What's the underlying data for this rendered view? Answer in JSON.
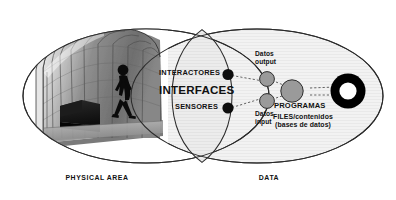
{
  "diagram": {
    "type": "venn-concept-diagram",
    "background_color": "#ffffff",
    "regions": {
      "left": {
        "label": "PHYSICAL AREA",
        "fill": "#ffffff",
        "stroke": "#2b2b2b",
        "photo": {
          "name": "vaulted-interactive-space-photo",
          "description": "grayscale photo of a curved vaulted tunnel space with segmented panels, a dark sofa and a walking person silhouette"
        }
      },
      "right": {
        "label": "DATA",
        "fill": "#f1f1f1",
        "stroke": "#2b2b2b"
      },
      "center": {
        "label": "INTERFACES",
        "fill": "#ebebeb",
        "stroke": "#2b2b2b"
      }
    },
    "center_items": [
      {
        "label": "INTERACTORES",
        "marker": "black-dot"
      },
      {
        "label": "SENSORES",
        "marker": "black-dot"
      }
    ],
    "data_nodes": [
      {
        "label": "Datos\noutput",
        "label_line1": "Datos",
        "label_line2": "output",
        "marker": "gray-circle"
      },
      {
        "label": "Datos\ninput",
        "label_line1": "Datos",
        "label_line2": "input",
        "marker": "gray-circle"
      },
      {
        "label": "PROGRAMAS",
        "marker": "gray-circle-large"
      },
      {
        "label_line1": "FILES/contenidos",
        "label_line2": "(bases de datos)",
        "marker": "black-ring"
      }
    ],
    "colors": {
      "stroke": "#2b2b2b",
      "text": "#111111",
      "dot_black": "#0d0d0d",
      "circle_gray": "#9a9a9a",
      "circle_gray_stroke": "#3a3a3a",
      "ring_black": "#000000",
      "right_fill": "#f1f1f1",
      "center_fill": "#ebebeb"
    },
    "connectors": {
      "style": "dashed",
      "color": "#4a4a4a"
    }
  }
}
